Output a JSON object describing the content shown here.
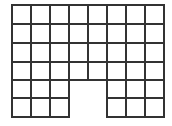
{
  "diagram": {
    "type": "grid-shape",
    "columns": 8,
    "rows": 6,
    "origin": {
      "x": 12,
      "y": 5
    },
    "col_edges": [
      12,
      31,
      50,
      69,
      88,
      107,
      126,
      145,
      164
    ],
    "row_edges": [
      5,
      24,
      43,
      62,
      80,
      98,
      117
    ],
    "missing_cells": [
      {
        "row": 4,
        "col": 3
      },
      {
        "row": 4,
        "col": 4
      },
      {
        "row": 5,
        "col": 3
      },
      {
        "row": 5,
        "col": 4
      }
    ],
    "line_color": "#333333",
    "line_width": 2,
    "background": "#ffffff"
  }
}
